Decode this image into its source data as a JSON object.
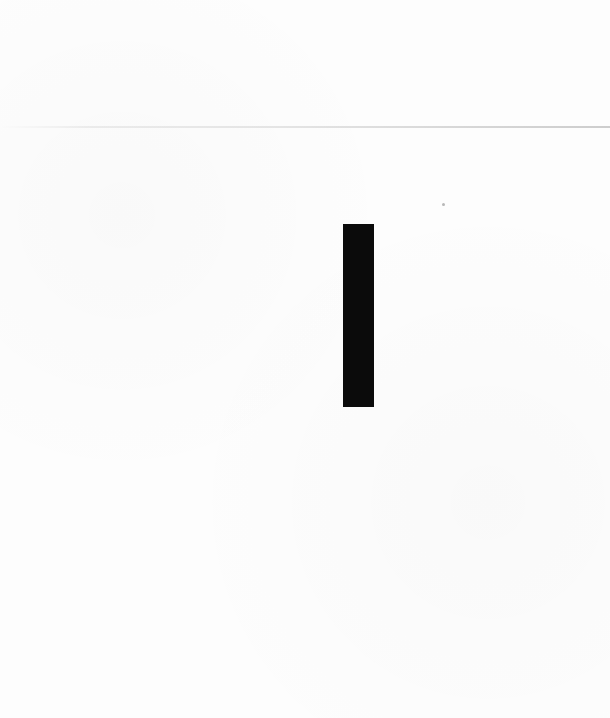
{
  "page": {
    "background_color": "#fdfdfd",
    "text_content": ""
  },
  "elements": {
    "scan_rule": {
      "orientation": "horizontal",
      "color": "#c0c0c0"
    },
    "redaction_bar": {
      "orientation": "vertical",
      "color": "#0b0b0b"
    },
    "speck": {
      "color": "#b8b8b8"
    }
  }
}
